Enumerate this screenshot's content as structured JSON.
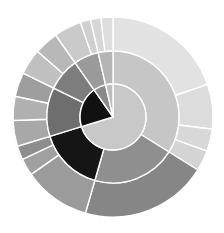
{
  "chart_data": {
    "type": "pie",
    "title": "",
    "subtitle": "",
    "xlabel": "",
    "ylabel": "",
    "legend": [],
    "annotations": [],
    "grid": false,
    "layout": {
      "center_x": 113,
      "center_y": 117,
      "inner_radius": 0,
      "ring_radii": [
        33,
        66,
        100
      ],
      "start_angle_deg": 0,
      "direction": "clockwise",
      "stroke_color": "#ffffff",
      "stroke_width": 1.4,
      "background": "#ffffff"
    },
    "rings": [
      {
        "name": "inner-ring",
        "r_inner": 0,
        "r_outer": 33,
        "slices": [
          {
            "label": "i1",
            "start": 0,
            "end": 253,
            "value": 70.3,
            "color": "#c8c8c8"
          },
          {
            "label": "i2",
            "start": 253,
            "end": 325,
            "value": 20.0,
            "color": "#111111"
          },
          {
            "label": "i3",
            "start": 325,
            "end": 347,
            "value": 6.1,
            "color": "#8a8a8a"
          },
          {
            "label": "i4",
            "start": 347,
            "end": 360,
            "value": 3.6,
            "color": "#bdbdbd"
          }
        ]
      },
      {
        "name": "middle-ring",
        "r_inner": 33,
        "r_outer": 66,
        "slices": [
          {
            "label": "m1",
            "start": 0,
            "end": 122,
            "value": 33.9,
            "color": "#c6c6c6"
          },
          {
            "label": "m2",
            "start": 122,
            "end": 196,
            "value": 20.6,
            "color": "#8f8f8f"
          },
          {
            "label": "m3",
            "start": 196,
            "end": 253,
            "value": 15.8,
            "color": "#151515"
          },
          {
            "label": "m4",
            "start": 253,
            "end": 296,
            "value": 11.9,
            "color": "#6e6e6e"
          },
          {
            "label": "m5",
            "start": 296,
            "end": 325,
            "value": 8.1,
            "color": "#7d7d7d"
          },
          {
            "label": "m6",
            "start": 325,
            "end": 347,
            "value": 6.1,
            "color": "#9a9a9a"
          },
          {
            "label": "m7",
            "start": 347,
            "end": 360,
            "value": 3.6,
            "color": "#b5b5b5"
          }
        ]
      },
      {
        "name": "outer-ring",
        "r_inner": 66,
        "r_outer": 100,
        "slices": [
          {
            "label": "o1",
            "start": 0,
            "end": 71,
            "value": 19.7,
            "color": "#e2e2e2"
          },
          {
            "label": "o2",
            "start": 71,
            "end": 97,
            "value": 7.2,
            "color": "#dcdcdc"
          },
          {
            "label": "o3",
            "start": 97,
            "end": 110,
            "value": 3.6,
            "color": "#d8d8d8"
          },
          {
            "label": "o4",
            "start": 110,
            "end": 122,
            "value": 3.3,
            "color": "#d4d4d4"
          },
          {
            "label": "o5",
            "start": 122,
            "end": 196,
            "value": 20.6,
            "color": "#868686"
          },
          {
            "label": "o6",
            "start": 196,
            "end": 235,
            "value": 10.8,
            "color": "#9b9b9b"
          },
          {
            "label": "o7",
            "start": 235,
            "end": 245,
            "value": 2.8,
            "color": "#a0a0a0"
          },
          {
            "label": "o8",
            "start": 245,
            "end": 253,
            "value": 2.2,
            "color": "#8d8d8d"
          },
          {
            "label": "o9",
            "start": 253,
            "end": 268,
            "value": 4.2,
            "color": "#a8a8a8"
          },
          {
            "label": "o10",
            "start": 268,
            "end": 282,
            "value": 3.9,
            "color": "#b0b0b0"
          },
          {
            "label": "o11",
            "start": 282,
            "end": 296,
            "value": 3.9,
            "color": "#9e9e9e"
          },
          {
            "label": "o12",
            "start": 296,
            "end": 311,
            "value": 4.2,
            "color": "#c0c0c0"
          },
          {
            "label": "o13",
            "start": 311,
            "end": 325,
            "value": 3.9,
            "color": "#b8b8b8"
          },
          {
            "label": "o14",
            "start": 325,
            "end": 341,
            "value": 4.4,
            "color": "#cacaca"
          },
          {
            "label": "o15",
            "start": 341,
            "end": 347,
            "value": 1.7,
            "color": "#d0d0d0"
          },
          {
            "label": "o16",
            "start": 347,
            "end": 353,
            "value": 1.7,
            "color": "#d6d6d6"
          },
          {
            "label": "o17",
            "start": 353,
            "end": 360,
            "value": 1.9,
            "color": "#dedede"
          }
        ]
      }
    ]
  }
}
